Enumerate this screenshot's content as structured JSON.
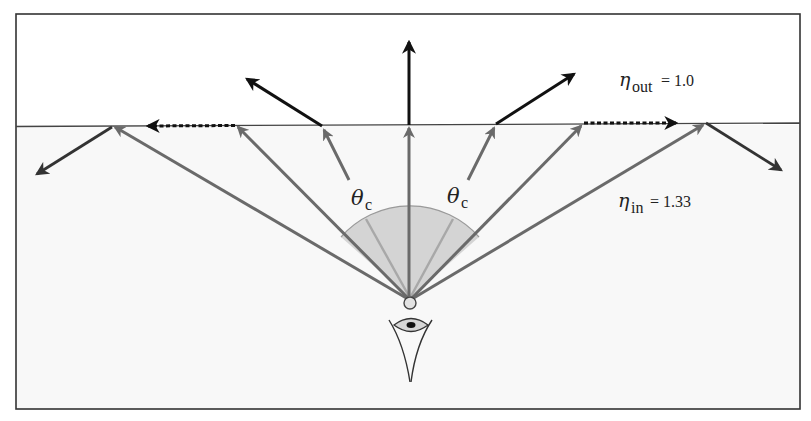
{
  "figure": {
    "colors": {
      "border": "#333333",
      "interface": "#444444",
      "water": "#f8f8f8",
      "air": "#ffffff",
      "incident_ray": "#6a6a6a",
      "transmitted_ray": "#111111",
      "cone_fill": "#cfcfcf",
      "cone_edge": "#9a9a9a",
      "cone_inner_line": "#a8a8a8"
    }
  },
  "labels": {
    "eta_out_symbol": "η",
    "eta_out_sub": "out",
    "eta_out_value": " = 1.0",
    "eta_in_symbol": "η",
    "eta_in_sub": "in",
    "eta_in_value": " = 1.33",
    "theta_c_left_symbol": "θ",
    "theta_c_left_sub": "c",
    "theta_c_right_symbol": "θ",
    "theta_c_right_sub": "c"
  },
  "media": {
    "outside": {
      "name": "air",
      "refractive_index": 1.0
    },
    "inside": {
      "name": "water",
      "refractive_index": 1.33
    }
  },
  "rays": [
    {
      "id": "far-left",
      "behavior": "total-internal-reflection"
    },
    {
      "id": "left-critical",
      "behavior": "grazing-along-surface"
    },
    {
      "id": "left-mid",
      "behavior": "refracted-out"
    },
    {
      "id": "center",
      "behavior": "normal-incidence"
    },
    {
      "id": "right-mid",
      "behavior": "refracted-out"
    },
    {
      "id": "right-critical",
      "behavior": "grazing-along-surface"
    },
    {
      "id": "far-right",
      "behavior": "total-internal-reflection"
    }
  ]
}
